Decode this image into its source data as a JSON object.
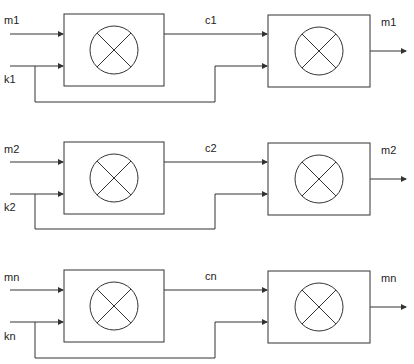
{
  "diagram": {
    "type": "xor-cipher-block-diagram",
    "stroke_color": "#333333",
    "operator_symbol": "circled-x",
    "rows": [
      {
        "input_label": "m1",
        "key_label": "k1",
        "cipher_label": "c1",
        "output_label": "m1"
      },
      {
        "input_label": "m2",
        "key_label": "k2",
        "cipher_label": "c2",
        "output_label": "m2"
      },
      {
        "input_label": "mn",
        "key_label": "kn",
        "cipher_label": "cn",
        "output_label": "mn"
      }
    ]
  }
}
